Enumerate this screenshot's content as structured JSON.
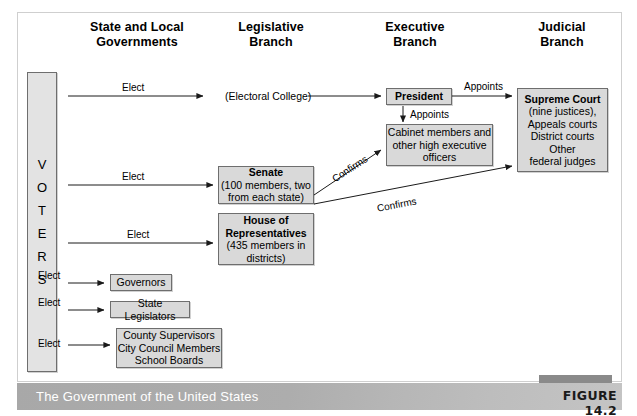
{
  "figure": {
    "caption": "The Government of the United States",
    "label": "FIGURE 14.2"
  },
  "columns": [
    {
      "line1": "State and Local",
      "line2": "Governments"
    },
    {
      "line1": "Legislative",
      "line2": "Branch"
    },
    {
      "line1": "Executive",
      "line2": "Branch"
    },
    {
      "line1": "Judicial",
      "line2": "Branch"
    }
  ],
  "voters": {
    "label": "VOTERS",
    "letters": [
      "V",
      "O",
      "T",
      "E",
      "R",
      "S"
    ]
  },
  "nodes": {
    "electoral_college": {
      "text": "(Electoral College)"
    },
    "president": {
      "title": "President"
    },
    "cabinet": {
      "line1": "Cabinet members and",
      "line2": "other high executive",
      "line3": "officers"
    },
    "supreme_court": {
      "title": "Supreme Court",
      "line2": "(nine justices),",
      "line3": "Appeals courts",
      "line4": "District courts",
      "line5": "Other",
      "line6": "federal judges"
    },
    "senate": {
      "title": "Senate",
      "line2": "(100 members, two",
      "line3": "from each state)"
    },
    "house": {
      "title1": "House of",
      "title2": "Representatives",
      "line3": "(435 members in",
      "line4": "districts)"
    },
    "governors": {
      "text": "Governors"
    },
    "state_legislators": {
      "text": "State Legislators"
    },
    "local": {
      "line1": "County Supervisors",
      "line2": "City Council Members",
      "line3": "School Boards"
    }
  },
  "edges": {
    "elect_electoral_college": "Elect",
    "elect_senate": "Elect",
    "elect_house": "Elect",
    "elect_governors": "Elect",
    "elect_state_legislators": "Elect",
    "elect_local": "Elect",
    "appoints_supreme_court": "Appoints",
    "appoints_cabinet": "Appoints",
    "confirms_cabinet": "Confirms",
    "confirms_courts": "Confirms"
  },
  "colors": {
    "box_fill": "#d9d9d9",
    "box_border": "#6e6e6e",
    "voters_fill": "#e3e3e3",
    "caption_band": "#b0b0b0",
    "frame_border": "#cfcfcf",
    "text": "#000000"
  }
}
